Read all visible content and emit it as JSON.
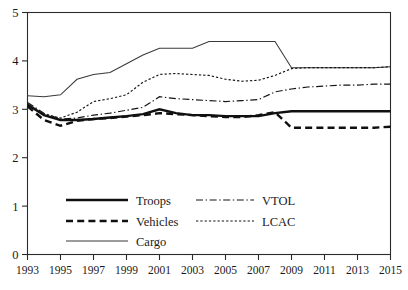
{
  "chart_data": {
    "type": "line",
    "title": "",
    "xlabel": "",
    "ylabel": "",
    "xlim": [
      1993,
      2015
    ],
    "ylim": [
      0,
      5
    ],
    "grid": false,
    "legend_position": "inside-bottom-left",
    "x": [
      1993,
      1994,
      1995,
      1996,
      1997,
      1998,
      1999,
      2000,
      2001,
      2002,
      2003,
      2004,
      2005,
      2006,
      2007,
      2008,
      2009,
      2010,
      2011,
      2012,
      2013,
      2014,
      2015
    ],
    "xticks": [
      1993,
      1995,
      1997,
      1999,
      2001,
      2003,
      2005,
      2007,
      2009,
      2011,
      2013,
      2015
    ],
    "xtick_labels": [
      "1993",
      "1995",
      "1997",
      "1999",
      "2001",
      "2003",
      "2005",
      "2007",
      "2009",
      "2011",
      "2013",
      "2015"
    ],
    "yticks": [
      0,
      1,
      2,
      3,
      4,
      5
    ],
    "ytick_labels": [
      "0",
      "1",
      "2",
      "3",
      "4",
      "5"
    ],
    "series": [
      {
        "name": "Troops",
        "style": "thick-solid",
        "values": [
          3.1,
          2.88,
          2.78,
          2.78,
          2.8,
          2.83,
          2.86,
          2.9,
          3.0,
          2.92,
          2.88,
          2.88,
          2.86,
          2.86,
          2.86,
          2.92,
          2.96,
          2.96,
          2.96,
          2.96,
          2.96,
          2.96,
          2.96
        ]
      },
      {
        "name": "Vehicles",
        "style": "thick-dashed",
        "values": [
          3.06,
          2.78,
          2.66,
          2.76,
          2.8,
          2.82,
          2.85,
          2.88,
          2.92,
          2.9,
          2.88,
          2.86,
          2.84,
          2.84,
          2.88,
          2.94,
          2.62,
          2.62,
          2.62,
          2.62,
          2.62,
          2.62,
          2.64
        ]
      },
      {
        "name": "Cargo",
        "style": "thin-solid",
        "values": [
          3.28,
          3.26,
          3.3,
          3.62,
          3.72,
          3.76,
          3.94,
          4.12,
          4.26,
          4.26,
          4.26,
          4.4,
          4.4,
          4.4,
          4.4,
          4.4,
          3.86,
          3.86,
          3.86,
          3.86,
          3.86,
          3.86,
          3.88
        ]
      },
      {
        "name": "VTOL",
        "style": "dash-dot",
        "values": [
          3.14,
          2.92,
          2.8,
          2.82,
          2.88,
          2.92,
          2.98,
          3.04,
          3.26,
          3.22,
          3.2,
          3.18,
          3.16,
          3.18,
          3.2,
          3.36,
          3.42,
          3.46,
          3.48,
          3.5,
          3.5,
          3.52,
          3.52
        ]
      },
      {
        "name": "LCAC",
        "style": "fine-dotted",
        "values": [
          3.08,
          2.9,
          2.82,
          2.94,
          3.16,
          3.22,
          3.3,
          3.56,
          3.72,
          3.74,
          3.72,
          3.7,
          3.62,
          3.58,
          3.6,
          3.7,
          3.84,
          3.86,
          3.86,
          3.86,
          3.86,
          3.86,
          3.88
        ]
      }
    ],
    "legend": [
      {
        "label": "Troops",
        "style": "thick-solid"
      },
      {
        "label": "Vehicles",
        "style": "thick-dashed"
      },
      {
        "label": "Cargo",
        "style": "thin-solid"
      },
      {
        "label": "VTOL",
        "style": "dash-dot"
      },
      {
        "label": "LCAC",
        "style": "fine-dotted"
      }
    ],
    "colors": {
      "axis": "#2b2b2b",
      "text": "#1a1a1a",
      "troops": "#101010",
      "vehicles": "#101010",
      "cargo": "#3a3a3a",
      "vtol": "#151515",
      "lcac": "#151515",
      "background": "#ffffff"
    }
  }
}
